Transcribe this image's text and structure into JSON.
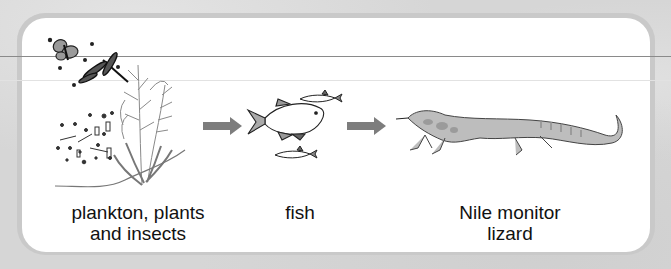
{
  "diagram": {
    "type": "food-chain",
    "nodes": [
      {
        "id": "producers",
        "label_line1": "plankton, plants",
        "label_line2": "and insects",
        "icon": "plankton-plants-insects-illustration"
      },
      {
        "id": "fish",
        "label_line1": "fish",
        "icon": "fish-illustration"
      },
      {
        "id": "lizard",
        "label_line1": "Nile monitor",
        "label_line2": "lizard",
        "icon": "nile-monitor-lizard-illustration"
      }
    ],
    "edges": [
      {
        "from": "producers",
        "to": "fish",
        "icon": "arrow-right-icon"
      },
      {
        "from": "fish",
        "to": "lizard",
        "icon": "arrow-right-icon"
      }
    ],
    "colors": {
      "arrow": "#7d7d7d",
      "panel": "#ffffff",
      "frame": "#c9c9c9",
      "background": "#d6d6d6",
      "lizard_fill": "#bdbdbd",
      "text": "#111111"
    }
  }
}
